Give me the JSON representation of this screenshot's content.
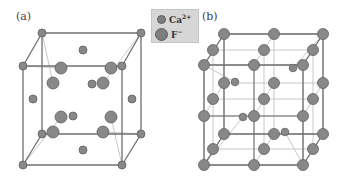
{
  "figure": {
    "panels": [
      {
        "label": "(a)",
        "description": "CaF2 fluorite unit cell"
      },
      {
        "label": "(b)",
        "description": "CaF2 structure viewed as F- simple cubic sublattice"
      }
    ],
    "legend": {
      "items": [
        {
          "ion": "Ca",
          "charge": "2+",
          "size": "small",
          "color": "#7d7d7d"
        },
        {
          "ion": "F",
          "charge": "−",
          "size": "large",
          "color": "#8a8a8a"
        }
      ]
    },
    "colors": {
      "edge_dark": "#6f6f6f",
      "edge_light": "#c8c8c8",
      "atom_fill": "#888888",
      "atom_stroke": "#5f5f5f",
      "legend_bg": "#d6d6d6"
    }
  },
  "panel_a": {
    "cube_vertices_Ca": [
      [
        42,
        33
      ],
      [
        141,
        33
      ],
      [
        23,
        66
      ],
      [
        122,
        66
      ],
      [
        42,
        134
      ],
      [
        141,
        134
      ],
      [
        23,
        165
      ],
      [
        122,
        165
      ]
    ],
    "face_centers_Ca": [
      [
        83,
        50
      ],
      [
        33,
        99
      ],
      [
        132,
        99
      ],
      [
        83,
        150
      ],
      [
        73,
        116
      ],
      [
        92,
        84
      ]
    ],
    "F_ions": [
      [
        61,
        68
      ],
      [
        111,
        68
      ],
      [
        53,
        83
      ],
      [
        103,
        83
      ],
      [
        61,
        117
      ],
      [
        111,
        117
      ],
      [
        53,
        132
      ],
      [
        103,
        132
      ]
    ]
  },
  "panel_b": {
    "F_grid": [
      [
        224,
        34
      ],
      [
        274,
        34
      ],
      [
        323,
        34
      ],
      [
        213,
        50
      ],
      [
        264,
        50
      ],
      [
        313,
        50
      ],
      [
        204,
        65
      ],
      [
        254,
        65
      ],
      [
        303,
        65
      ],
      [
        224,
        83
      ],
      [
        274,
        83
      ],
      [
        323,
        83
      ],
      [
        213,
        99
      ],
      [
        264,
        99
      ],
      [
        313,
        99
      ],
      [
        204,
        116
      ],
      [
        254,
        116
      ],
      [
        303,
        116
      ],
      [
        224,
        134
      ],
      [
        274,
        134
      ],
      [
        323,
        134
      ],
      [
        213,
        149
      ],
      [
        264,
        149
      ],
      [
        313,
        149
      ],
      [
        204,
        165
      ],
      [
        254,
        165
      ],
      [
        303,
        165
      ]
    ],
    "Ca_ions": [
      [
        235,
        82
      ],
      [
        293,
        68
      ],
      [
        243,
        117
      ],
      [
        285,
        132
      ]
    ]
  }
}
